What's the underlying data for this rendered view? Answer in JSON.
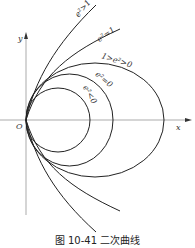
{
  "figure": {
    "caption": "图 10-41  二次曲线",
    "axes": {
      "x_label": "x",
      "y_label": "y",
      "origin_label": "O"
    },
    "curves": [
      {
        "name": "hyperbola",
        "label": "e²>1"
      },
      {
        "name": "parabola",
        "label": "e²=1"
      },
      {
        "name": "ellipse",
        "label": "1>e²>0"
      },
      {
        "name": "ellipse-e0",
        "label": "e²=0"
      },
      {
        "name": "circle",
        "label": "e²<0"
      }
    ]
  }
}
